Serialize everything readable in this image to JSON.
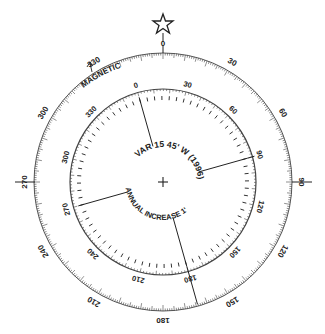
{
  "diagram": {
    "true_ring": {
      "labels": [
        "0",
        "30",
        "60",
        "90",
        "120",
        "150",
        "180",
        "210",
        "240",
        "270",
        "300",
        "330"
      ],
      "degrees": [
        0,
        30,
        60,
        90,
        120,
        150,
        180,
        210,
        240,
        270,
        300,
        330
      ]
    },
    "magnetic_ring": {
      "label": "MAGNETIC",
      "labels": [
        "0",
        "30",
        "60",
        "90",
        "120",
        "150",
        "180",
        "210",
        "240",
        "270",
        "300",
        "330"
      ],
      "degrees": [
        0,
        30,
        60,
        90,
        120,
        150,
        180,
        210,
        240,
        270,
        300,
        330
      ],
      "rotation_deg": -15.75
    },
    "north_marker": "star-icon",
    "variation_text": "VAR 15 45' W (1996)",
    "annual_change_text": "ANNUAL INCREASE 1'",
    "colors": {
      "ink": "#222222",
      "background": "#ffffff"
    }
  }
}
